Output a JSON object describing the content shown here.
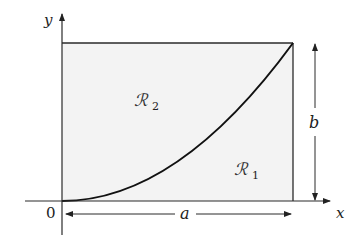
{
  "diagram": {
    "axes": {
      "x_label": "x",
      "y_label": "y",
      "origin_label": "0"
    },
    "dimensions": {
      "width_label": "a",
      "height_label": "b"
    },
    "regions": [
      {
        "id": "R2",
        "symbol": "ℛ",
        "subscript": "2",
        "position": "above curve"
      },
      {
        "id": "R1",
        "symbol": "ℛ",
        "subscript": "1",
        "position": "below curve"
      }
    ],
    "colors": {
      "fill": "#f3f3f3",
      "stroke": "#2a2a2a",
      "curve": "#111111"
    }
  }
}
